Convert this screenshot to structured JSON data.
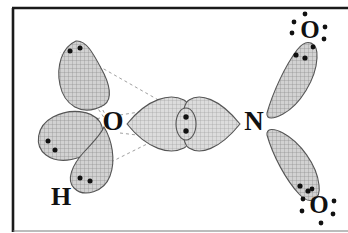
{
  "figure": {
    "name": "orbital-overlap-diagram",
    "frame": {
      "border_color": "#1a1a1a",
      "background": "#ffffff"
    },
    "style": {
      "lobe_fill": "#c9c9c9",
      "lobe_stroke": "#555555",
      "hatch_color": "#8d8d8d",
      "dot_color": "#111111",
      "dashed_line_color": "#9a9a9a",
      "label_color": "#111111"
    },
    "atom_labels": [
      {
        "id": "label-o-left",
        "text": "O",
        "x": 113,
        "y": 124,
        "size": 27
      },
      {
        "id": "label-h-bottom-left",
        "text": "H",
        "x": 61,
        "y": 199,
        "size": 26
      },
      {
        "id": "label-n-center",
        "text": "N",
        "x": 254,
        "y": 124,
        "size": 27
      },
      {
        "id": "label-o-top-right",
        "text": "O",
        "x": 310,
        "y": 32,
        "size": 25
      },
      {
        "id": "label-o-bottom-right",
        "text": "O",
        "x": 319,
        "y": 207,
        "size": 25
      }
    ],
    "orbital_lobes": [
      {
        "id": "lobe-o-upper-left",
        "name": "upper-left-lone-pair-lobe"
      },
      {
        "id": "lobe-o-left",
        "name": "left-lone-pair-lobe"
      },
      {
        "id": "lobe-o-h-bond",
        "name": "oxygen-hydrogen-bonding-lobe"
      },
      {
        "id": "lobe-o-sigma-right",
        "name": "oxygen-sigma-lobe"
      },
      {
        "id": "lobe-n-sigma-left",
        "name": "nitrogen-sigma-lobe"
      },
      {
        "id": "lobe-n-upper-right",
        "name": "nitrogen-upper-right-lobe"
      },
      {
        "id": "lobe-n-lower-right",
        "name": "nitrogen-lower-right-lobe"
      },
      {
        "id": "overlap-oval",
        "name": "sigma-bond-overlap-oval"
      }
    ],
    "electron_dot_groups": [
      {
        "id": "dots-upper-left-lobe",
        "count": 2
      },
      {
        "id": "dots-left-lobe",
        "count": 2
      },
      {
        "id": "dots-h-lobe",
        "count": 2
      },
      {
        "id": "dots-overlap-oval",
        "count": 2
      },
      {
        "id": "dots-upper-right-lobe",
        "count": 2
      },
      {
        "id": "dots-lower-right-lobe",
        "count": 2
      },
      {
        "id": "dots-o-top-right-label",
        "count": 6
      },
      {
        "id": "dots-o-bottom-right-label",
        "count": 6
      }
    ],
    "dashed_guides": {
      "name": "hybrid-orbital-axis-guides",
      "count": 6
    }
  }
}
